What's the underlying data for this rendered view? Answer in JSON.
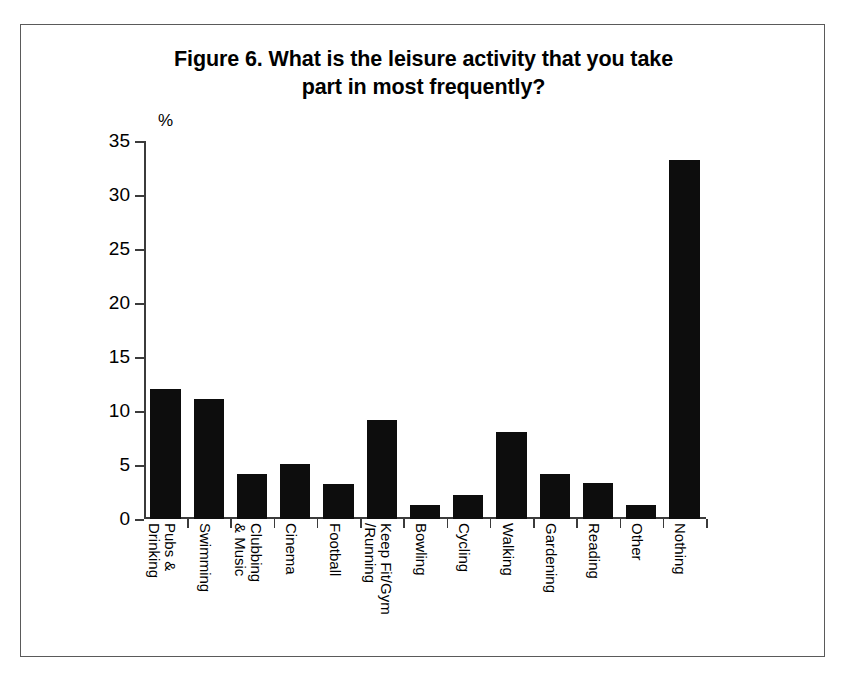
{
  "figure": {
    "title": "Figure 6. What is the leisure activity that you take part in most frequently?",
    "title_line1": "Figure 6. What is the leisure activity that you take",
    "title_line2": "part in most frequently?",
    "axis_unit_label": "%",
    "frame_color": "#5a5a5a",
    "bar_color": "#0d0d0d",
    "axis_color": "#3b3b3b",
    "background_color": "#ffffff"
  },
  "chart_data": {
    "type": "bar",
    "title": "Figure 6. What is the leisure activity that you take part in most frequently?",
    "xlabel": "",
    "ylabel": "%",
    "ylim": [
      0,
      35
    ],
    "ytick_step": 5,
    "yticks": [
      0,
      5,
      10,
      15,
      20,
      25,
      30,
      35
    ],
    "ytick_labels": [
      "0",
      "5",
      "10",
      "15",
      "20",
      "25",
      "30",
      "35"
    ],
    "grid": false,
    "legend": false,
    "legend_position": "none",
    "categories": [
      "Pubs & Drinking",
      "Swimming",
      "Clubbing & Music",
      "Cinema",
      "Football",
      "Keep Fit/Gym /Running",
      "Bowling",
      "Cycling",
      "Walking",
      "Gardening",
      "Reading",
      "Other",
      "Nothing"
    ],
    "category_label_lines": [
      [
        "Pubs &",
        "Drinking"
      ],
      [
        "Swimming"
      ],
      [
        "Clubbing",
        "& Music"
      ],
      [
        "Cinema"
      ],
      [
        "Football"
      ],
      [
        "Keep Fit/Gym",
        "/Running"
      ],
      [
        "Bowling"
      ],
      [
        "Cycling"
      ],
      [
        "Walking"
      ],
      [
        "Gardening"
      ],
      [
        "Reading"
      ],
      [
        "Other"
      ],
      [
        "Nothing"
      ]
    ],
    "values": [
      12.0,
      11.1,
      4.2,
      5.1,
      3.2,
      9.2,
      1.3,
      2.2,
      8.1,
      4.2,
      3.3,
      1.3,
      33.2
    ]
  }
}
